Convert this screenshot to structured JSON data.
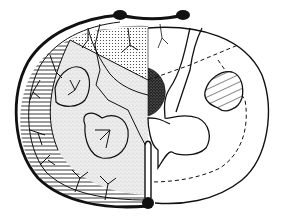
{
  "figure": {
    "colors": {
      "background": "#ffffff",
      "ink": "#111111",
      "stipple_light": "#d9d9d9",
      "stipple_dark": "#2a2a2a"
    },
    "regions": [
      {
        "name": "peripheral-rim-territory",
        "fill": "horizontal-hatch"
      },
      {
        "name": "posterior-column-territory",
        "fill": "dots"
      },
      {
        "name": "central-territory",
        "fill": "light-stipple"
      },
      {
        "name": "dorsal-horn-lesion",
        "fill": "dark-stipple"
      },
      {
        "name": "lateral-tract",
        "fill": "diagonal-hatch"
      }
    ],
    "vessels": [
      {
        "name": "posterior-spinal-artery-left"
      },
      {
        "name": "posterior-spinal-artery-right"
      },
      {
        "name": "anterior-spinal-artery"
      }
    ]
  }
}
